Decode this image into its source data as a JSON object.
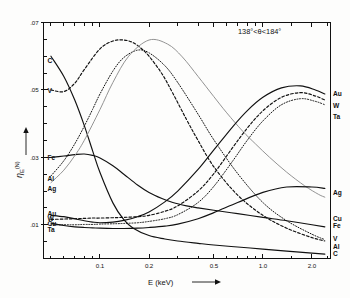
{
  "figure": {
    "annotation": "138°<θ<184°",
    "x_axis_title": "E (keV)",
    "y_axis_symbol": "η",
    "y_axis_subscript": "E",
    "y_axis_superscript": "(N)"
  },
  "chart_data": {
    "type": "line",
    "title": "",
    "subtitle": "",
    "xlabel": "E (keV)",
    "ylabel": "η_E^(N)",
    "annotations": [
      "138°<θ<184°"
    ],
    "xscale": "log",
    "yscale": "linear",
    "xlim": [
      0.045,
      2.6
    ],
    "ylim": [
      0.0,
      0.07
    ],
    "grid": false,
    "legend_position": "inline-curve-labels",
    "x_ticks_major": [
      0.1,
      0.2,
      0.5,
      1.0,
      2.0
    ],
    "x_tick_labels": [
      "0.1",
      "0.2",
      "0.5",
      "1.0",
      "2.0"
    ],
    "x_ticks_minor": [
      0.05,
      0.06,
      0.07,
      0.08,
      0.09,
      0.3,
      0.4,
      0.6,
      0.7,
      0.8,
      0.9,
      1.5,
      2.5
    ],
    "y_ticks_major": [
      0.01,
      0.03,
      0.05,
      0.07
    ],
    "y_tick_labels": [
      ".01",
      ".03",
      ".05",
      ".07"
    ],
    "y_ticks_minor": [
      0.005,
      0.015,
      0.02,
      0.025,
      0.035,
      0.04,
      0.045,
      0.055,
      0.06,
      0.065
    ],
    "series": [
      {
        "name": "C",
        "label_left": "C",
        "label_right": "C",
        "style": "solid",
        "x": [
          0.05,
          0.06,
          0.07,
          0.08,
          0.09,
          0.1,
          0.12,
          0.14,
          0.16,
          0.2,
          0.25,
          0.3,
          0.4,
          0.5,
          0.7,
          1.0,
          1.4,
          2.0,
          2.4
        ],
        "y": [
          0.06,
          0.054,
          0.047,
          0.0395,
          0.032,
          0.0255,
          0.0165,
          0.0115,
          0.009,
          0.0068,
          0.0058,
          0.0052,
          0.0045,
          0.004,
          0.0034,
          0.0028,
          0.0022,
          0.0016,
          0.0013
        ]
      },
      {
        "name": "V",
        "label_left": "V",
        "label_right": "V",
        "style": "dashed",
        "x": [
          0.05,
          0.06,
          0.07,
          0.08,
          0.1,
          0.12,
          0.14,
          0.16,
          0.18,
          0.2,
          0.24,
          0.28,
          0.34,
          0.4,
          0.5,
          0.7,
          1.0,
          1.4,
          2.0,
          2.4
        ],
        "y": [
          0.05,
          0.0495,
          0.052,
          0.056,
          0.0622,
          0.0645,
          0.0648,
          0.064,
          0.0622,
          0.06,
          0.0548,
          0.049,
          0.0412,
          0.035,
          0.0272,
          0.0188,
          0.0128,
          0.009,
          0.0062,
          0.0052
        ]
      },
      {
        "name": "Fe",
        "label_left": "Fe",
        "label_right": "Fe",
        "style": "solid",
        "x": [
          0.05,
          0.06,
          0.07,
          0.08,
          0.09,
          0.1,
          0.12,
          0.14,
          0.17,
          0.2,
          0.24,
          0.28,
          0.34,
          0.4,
          0.5,
          0.7,
          1.0,
          1.4,
          2.0,
          2.4
        ],
        "y": [
          0.03,
          0.0304,
          0.0308,
          0.031,
          0.0306,
          0.0298,
          0.0275,
          0.025,
          0.0218,
          0.0196,
          0.0178,
          0.0166,
          0.0156,
          0.015,
          0.0143,
          0.0133,
          0.0122,
          0.0112,
          0.01,
          0.0094
        ]
      },
      {
        "name": "Al",
        "label_left": "Al",
        "label_right": "Al",
        "style": "dotted",
        "x": [
          0.05,
          0.06,
          0.07,
          0.08,
          0.09,
          0.1,
          0.12,
          0.14,
          0.17,
          0.2,
          0.25,
          0.3,
          0.4,
          0.5,
          0.7,
          1.0,
          1.4,
          2.0,
          2.4
        ],
        "y": [
          0.0245,
          0.029,
          0.034,
          0.0392,
          0.0442,
          0.0488,
          0.0556,
          0.0596,
          0.0618,
          0.061,
          0.0572,
          0.0522,
          0.0428,
          0.0352,
          0.0252,
          0.0166,
          0.0112,
          0.0072,
          0.0056
        ]
      },
      {
        "name": "Ag",
        "label_left": "Ag",
        "label_right": "Ag",
        "style": "thin",
        "x": [
          0.05,
          0.06,
          0.07,
          0.08,
          0.1,
          0.12,
          0.15,
          0.2,
          0.26,
          0.32,
          0.4,
          0.5,
          0.6,
          0.75,
          0.9,
          1.1,
          1.4,
          1.8,
          2.2,
          2.4
        ],
        "y": [
          0.0225,
          0.0262,
          0.0305,
          0.035,
          0.0442,
          0.0522,
          0.06,
          0.0648,
          0.0636,
          0.0598,
          0.054,
          0.048,
          0.0432,
          0.0378,
          0.034,
          0.03,
          0.0256,
          0.0216,
          0.019,
          0.0182
        ]
      },
      {
        "name": "Au",
        "label_left": "Au",
        "label_right": "Au",
        "style": "solid",
        "x": [
          0.05,
          0.06,
          0.07,
          0.08,
          0.09,
          0.1,
          0.12,
          0.14,
          0.17,
          0.2,
          0.25,
          0.3,
          0.4,
          0.5,
          0.65,
          0.8,
          1.0,
          1.3,
          1.7,
          2.1,
          2.4
        ],
        "y": [
          0.0128,
          0.0124,
          0.0118,
          0.0112,
          0.0108,
          0.0106,
          0.0108,
          0.0113,
          0.0124,
          0.0138,
          0.0168,
          0.02,
          0.0264,
          0.0322,
          0.039,
          0.0438,
          0.0478,
          0.0506,
          0.0512,
          0.05,
          0.0488
        ]
      },
      {
        "name": "W",
        "label_left": "W",
        "label_right": "W",
        "style": "dashed",
        "x": [
          0.05,
          0.06,
          0.07,
          0.08,
          0.09,
          0.1,
          0.12,
          0.14,
          0.17,
          0.2,
          0.25,
          0.3,
          0.4,
          0.5,
          0.65,
          0.8,
          1.0,
          1.3,
          1.7,
          2.1,
          2.4
        ],
        "y": [
          0.0116,
          0.0117,
          0.0118,
          0.0119,
          0.012,
          0.012,
          0.0121,
          0.0122,
          0.0124,
          0.0128,
          0.014,
          0.0156,
          0.02,
          0.0252,
          0.0328,
          0.0386,
          0.0438,
          0.0478,
          0.0492,
          0.0482,
          0.047
        ]
      },
      {
        "name": "Cu",
        "label_left": "Cu",
        "label_right": "Cu",
        "style": "solid",
        "x": [
          0.05,
          0.06,
          0.07,
          0.08,
          0.09,
          0.1,
          0.12,
          0.14,
          0.17,
          0.2,
          0.25,
          0.3,
          0.4,
          0.5,
          0.7,
          1.0,
          1.4,
          2.0,
          2.4
        ],
        "y": [
          0.0105,
          0.0098,
          0.0094,
          0.0092,
          0.0091,
          0.009,
          0.0089,
          0.0089,
          0.009,
          0.0092,
          0.0096,
          0.0102,
          0.0118,
          0.0136,
          0.0166,
          0.0196,
          0.0212,
          0.0212,
          0.0208
        ]
      },
      {
        "name": "Ta",
        "label_left": "Ta",
        "label_right": "Ta",
        "style": "dotted",
        "x": [
          0.05,
          0.06,
          0.07,
          0.08,
          0.09,
          0.1,
          0.12,
          0.14,
          0.17,
          0.2,
          0.25,
          0.3,
          0.4,
          0.5,
          0.65,
          0.8,
          1.0,
          1.3,
          1.7,
          2.1,
          2.4
        ],
        "y": [
          0.01,
          0.01,
          0.01,
          0.0101,
          0.0101,
          0.0102,
          0.0103,
          0.0104,
          0.0106,
          0.011,
          0.0118,
          0.013,
          0.0166,
          0.0214,
          0.0288,
          0.035,
          0.0408,
          0.0456,
          0.0474,
          0.0466,
          0.0456
        ]
      }
    ],
    "left_labels": [
      {
        "text": "C",
        "y_value": 0.0588
      },
      {
        "text": "V",
        "y_value": 0.0498
      },
      {
        "text": "Fe",
        "y_value": 0.03
      },
      {
        "text": "Al",
        "y_value": 0.0238
      },
      {
        "text": "Ag",
        "y_value": 0.0208
      },
      {
        "text": "Au",
        "y_value": 0.0134
      },
      {
        "text": "W",
        "y_value": 0.0118
      },
      {
        "text": "Cu",
        "y_value": 0.0102
      },
      {
        "text": "Ta",
        "y_value": 0.0086
      }
    ],
    "right_labels": [
      {
        "text": "Au",
        "y_value": 0.049
      },
      {
        "text": "W",
        "y_value": 0.0452
      },
      {
        "text": "Ta",
        "y_value": 0.042
      },
      {
        "text": "Ag",
        "y_value": 0.0196
      },
      {
        "text": "Cu",
        "y_value": 0.0118
      },
      {
        "text": "Fe",
        "y_value": 0.0096
      },
      {
        "text": "V",
        "y_value": 0.0058
      },
      {
        "text": "Al",
        "y_value": 0.0034
      },
      {
        "text": "C",
        "y_value": 0.0014
      }
    ]
  }
}
